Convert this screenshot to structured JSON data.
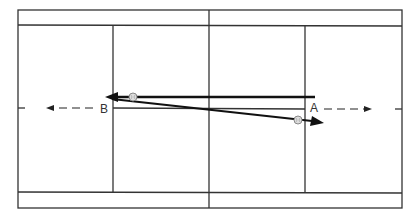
{
  "diagram": {
    "type": "tennis-court-rally",
    "colors": {
      "background": "#ffffff",
      "court_lines": "#333333",
      "shot_arrows": "#111111",
      "movement_arrows": "#222222",
      "ball_fill": "#dddddd",
      "ball_stroke": "#888888"
    },
    "players": [
      {
        "id": "A",
        "label": "A",
        "x": 316,
        "y": 112
      },
      {
        "id": "B",
        "label": "B",
        "x": 104,
        "y": 113
      }
    ],
    "shots": [
      {
        "from": "A",
        "to": "B",
        "x1": 315,
        "y1": 97,
        "x2": 106,
        "y2": 97,
        "ball": {
          "x": 133,
          "y": 97
        }
      },
      {
        "from": "B",
        "to": "A",
        "x1": 112,
        "y1": 99,
        "x2": 322,
        "y2": 122,
        "ball": {
          "x": 298,
          "y": 120
        }
      }
    ],
    "movements": [
      {
        "player": "B",
        "direction": "left",
        "x1": 93,
        "x2": 46,
        "y": 108
      },
      {
        "player": "A",
        "direction": "right",
        "x1": 324,
        "x2": 372,
        "y": 109
      }
    ]
  }
}
